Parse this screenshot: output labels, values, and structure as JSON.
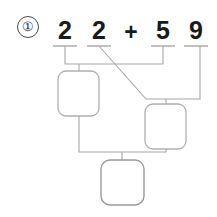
{
  "problem": {
    "marker": "①",
    "expression_digits": [
      "2",
      "2",
      "5",
      "9"
    ],
    "operator": "+",
    "full_expression": "22 + 59",
    "addend_left": "22",
    "addend_right": "59"
  },
  "digits": [
    {
      "name": "tens-digit-first-addend",
      "value": "2"
    },
    {
      "name": "ones-digit-first-addend",
      "value": "2"
    },
    {
      "name": "tens-digit-second-addend",
      "value": "5"
    },
    {
      "name": "ones-digit-second-addend",
      "value": "9"
    }
  ],
  "operator_label": "+",
  "answer_boxes": [
    {
      "name": "tens-sum-box",
      "value": "",
      "placeholder": ""
    },
    {
      "name": "ones-sum-box",
      "value": "",
      "placeholder": ""
    },
    {
      "name": "total-sum-box",
      "value": "",
      "placeholder": ""
    }
  ],
  "colors": {
    "digit_text": "#1a1a1a",
    "marker_text": "#333333",
    "marker_border": "#4a4a4a",
    "connector_line": "#a8a8a8",
    "digit_underline": "#8f8f8f",
    "box_border": "#b0b0b0",
    "background": "#ffffff"
  },
  "diagram": {
    "type": "addition-decomposition-tree"
  }
}
